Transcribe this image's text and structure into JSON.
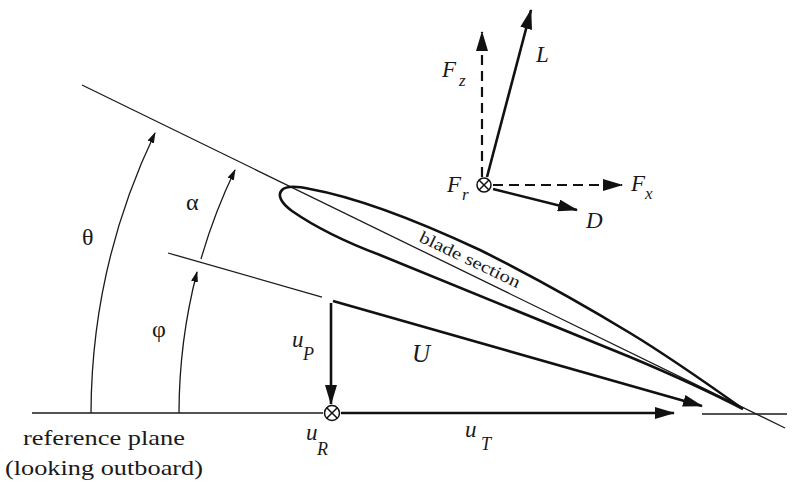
{
  "diagram": {
    "angles": {
      "theta": "θ",
      "alpha": "α",
      "phi": "φ"
    },
    "blade_section_label": "blade section",
    "resultant_velocity": "U",
    "velocity_components": {
      "perpendicular": {
        "symbol": "u",
        "subscript": "P"
      },
      "radial": {
        "symbol": "u",
        "subscript": "R"
      },
      "tangential": {
        "symbol": "u",
        "subscript": "T"
      }
    },
    "forces": {
      "lift": "L",
      "drag": "D",
      "normal": {
        "symbol": "F",
        "subscript": "z"
      },
      "inplane": {
        "symbol": "F",
        "subscript": "x"
      },
      "radial": {
        "symbol": "F",
        "subscript": "r"
      }
    },
    "reference_plane": {
      "line1": "reference plane",
      "line2": "(looking outboard)"
    },
    "icons": {
      "into_page": "circled-times-icon"
    },
    "colors": {
      "ink": "#111111",
      "background": "#ffffff"
    }
  }
}
